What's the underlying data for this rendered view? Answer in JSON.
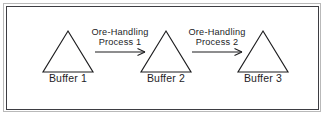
{
  "figure": {
    "width": 327,
    "height": 117,
    "background_color": "#ffffff",
    "stroke_color": "#1d1d1f",
    "text_color": "#1d1d1f",
    "outer_border_color": "#b9b9b9",
    "inner_border_color": "#3d3d42"
  },
  "diagram": {
    "type": "flow",
    "node_shape": "triangle",
    "nodes": [
      {
        "id": "buffer-1",
        "label": "Buffer 1",
        "apex_x": 68,
        "apex_y": 31,
        "base_left_x": 43,
        "base_right_x": 93,
        "base_y": 72
      },
      {
        "id": "buffer-2",
        "label": "Buffer 2",
        "apex_x": 166,
        "apex_y": 31,
        "base_left_x": 141,
        "base_right_x": 191,
        "base_y": 72
      },
      {
        "id": "buffer-3",
        "label": "Buffer 3",
        "apex_x": 263,
        "apex_y": 31,
        "base_left_x": 238,
        "base_right_x": 288,
        "base_y": 72
      }
    ],
    "edges": [
      {
        "id": "process-1",
        "from": "buffer-1",
        "to": "buffer-2",
        "label_line_1": "Ore-Handling",
        "label_line_2": "Process 1",
        "start_x": 95,
        "end_x": 145,
        "y": 52
      },
      {
        "id": "process-2",
        "from": "buffer-2",
        "to": "buffer-3",
        "label_line_1": "Ore-Handling",
        "label_line_2": "Process 2",
        "start_x": 192,
        "end_x": 242,
        "y": 52
      }
    ]
  }
}
